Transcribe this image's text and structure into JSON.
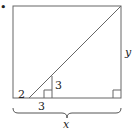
{
  "figure": {
    "marker": "•",
    "labels": {
      "left_segment": "2",
      "vertical_height": "3",
      "bottom_segment": "3",
      "right_side": "y",
      "total_width": "x"
    },
    "colors": {
      "stroke": "#555555",
      "text": "#222222"
    }
  }
}
